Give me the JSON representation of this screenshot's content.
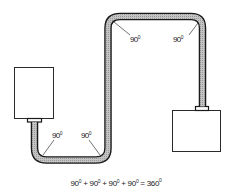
{
  "diagram": {
    "colors": {
      "pipe_fill": "#b8b8b8",
      "pipe_outline": "#1a1a1a",
      "box_outline": "#2a2a2a",
      "label": "#222222"
    },
    "left_box": {
      "label": ""
    },
    "right_box": {
      "label": ""
    },
    "bends": [
      {
        "id": "bottom-left",
        "value": "90",
        "unit": "0"
      },
      {
        "id": "bottom-right",
        "value": "90",
        "unit": "0"
      },
      {
        "id": "top-left",
        "value": "90",
        "unit": "0"
      },
      {
        "id": "top-right",
        "value": "90",
        "unit": "0"
      }
    ],
    "equation": {
      "terms": [
        "90",
        "90",
        "90",
        "90"
      ],
      "term_unit": "0",
      "plus": "+",
      "equals": "=",
      "total": "360",
      "total_unit": "0"
    }
  }
}
